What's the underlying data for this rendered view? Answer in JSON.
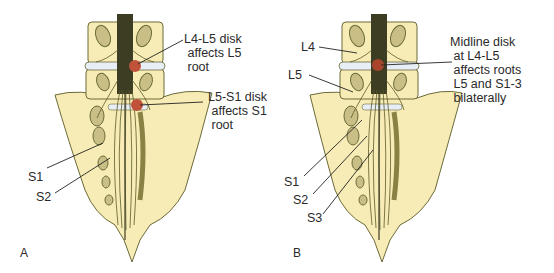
{
  "figure": {
    "panels": [
      {
        "id": "A",
        "panel_label": "A",
        "callouts": [
          {
            "text": "L4-L5 disk\n affects L5\n root",
            "target": "L4-L5 disk herniation (lateral)"
          },
          {
            "text": "L5-S1 disk\n affects S1\n root",
            "target": "L5-S1 disk herniation (lateral)"
          }
        ],
        "root_labels": [
          "S1",
          "S2"
        ]
      },
      {
        "id": "B",
        "panel_label": "B",
        "callouts": [
          {
            "text": "Midline disk\n at L4-L5\n affects roots\n L5 and S1-3\n bilaterally",
            "target": "midline L4-L5 disk herniation"
          }
        ],
        "root_labels": [
          "L4",
          "L5",
          "S1",
          "S2",
          "S3"
        ]
      }
    ],
    "colors": {
      "bone": "#f7ecb5",
      "outline": "#6b6a3a",
      "nerve": "#5c5a2a",
      "cord": "#3d3d24",
      "disk": "#e8eef5",
      "herniation": "#c0523a",
      "leader": "#222222"
    }
  }
}
